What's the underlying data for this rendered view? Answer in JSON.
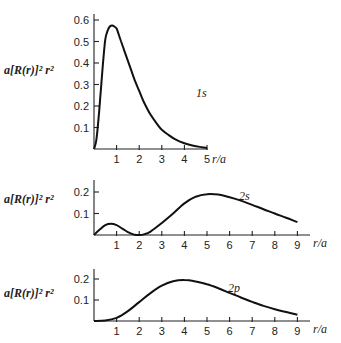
{
  "chart_data": [
    {
      "type": "line",
      "title": "",
      "ylabel": "a[R(r)]² r²",
      "xlabel": "r/a",
      "curve_label": "1s",
      "xlim": [
        0,
        5
      ],
      "ylim": [
        0,
        0.6
      ],
      "xticks": [
        1,
        2,
        3,
        4,
        5
      ],
      "yticks": [
        0.1,
        0.2,
        0.3,
        0.4,
        0.5,
        0.6
      ],
      "ytick_labels": [
        "0.1",
        "0.2",
        "0.3",
        "0.4",
        "0.5",
        "0.6"
      ],
      "series": [
        {
          "name": "1s",
          "x": [
            0,
            0.1,
            0.2,
            0.3,
            0.4,
            0.5,
            0.6,
            0.7,
            0.8,
            0.9,
            1.0,
            1.1,
            1.2,
            1.4,
            1.6,
            1.8,
            2.0,
            2.2,
            2.5,
            2.8,
            3.0,
            3.3,
            3.6,
            4.0,
            4.4,
            4.8,
            5.0
          ],
          "y": [
            0,
            0.04,
            0.14,
            0.27,
            0.4,
            0.51,
            0.55,
            0.57,
            0.575,
            0.57,
            0.56,
            0.53,
            0.5,
            0.44,
            0.38,
            0.32,
            0.27,
            0.22,
            0.16,
            0.115,
            0.09,
            0.065,
            0.045,
            0.027,
            0.015,
            0.008,
            0.005
          ]
        }
      ]
    },
    {
      "type": "line",
      "title": "",
      "ylabel": "a[R(r)]² r²",
      "xlabel": "r/a",
      "curve_label": "2s",
      "xlim": [
        0,
        9
      ],
      "ylim": [
        0,
        0.2
      ],
      "xticks": [
        1,
        2,
        3,
        4,
        5,
        6,
        7,
        8,
        9
      ],
      "yticks": [
        0.1,
        0.2
      ],
      "ytick_labels": [
        "0.1",
        "0.2"
      ],
      "series": [
        {
          "name": "2s",
          "x": [
            0,
            0.25,
            0.5,
            0.75,
            1.0,
            1.25,
            1.5,
            1.75,
            2.0,
            2.25,
            2.5,
            3.0,
            3.5,
            4.0,
            4.5,
            5.0,
            5.5,
            6.0,
            6.5,
            7.0,
            7.5,
            8.0,
            8.5,
            9.0
          ],
          "y": [
            0,
            0.025,
            0.046,
            0.052,
            0.046,
            0.03,
            0.013,
            0.003,
            0,
            0.004,
            0.016,
            0.056,
            0.1,
            0.147,
            0.178,
            0.19,
            0.188,
            0.176,
            0.16,
            0.14,
            0.12,
            0.1,
            0.08,
            0.06
          ]
        }
      ]
    },
    {
      "type": "line",
      "title": "",
      "ylabel": "a[R(r)]² r²",
      "xlabel": "r/a",
      "curve_label": "2p",
      "xlim": [
        0,
        9
      ],
      "ylim": [
        0,
        0.2
      ],
      "xticks": [
        1,
        2,
        3,
        4,
        5,
        6,
        7,
        8,
        9
      ],
      "yticks": [
        0.1,
        0.2
      ],
      "ytick_labels": [
        "0.1",
        "0.2"
      ],
      "series": [
        {
          "name": "2p",
          "x": [
            0,
            0.5,
            1.0,
            1.5,
            2.0,
            2.5,
            3.0,
            3.5,
            4.0,
            4.5,
            5.0,
            5.5,
            6.0,
            6.5,
            7.0,
            7.5,
            8.0,
            8.5,
            9.0
          ],
          "y": [
            0,
            0.002,
            0.015,
            0.047,
            0.09,
            0.133,
            0.168,
            0.189,
            0.195,
            0.188,
            0.175,
            0.156,
            0.134,
            0.112,
            0.091,
            0.072,
            0.056,
            0.043,
            0.03
          ]
        }
      ]
    }
  ]
}
